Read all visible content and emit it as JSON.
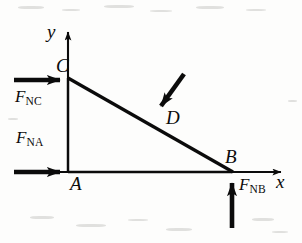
{
  "figure": {
    "type": "free-body-diagram",
    "background_color": "#fdfdfc",
    "ink_color": "#0b0b0b"
  },
  "axes": {
    "x_label": "x",
    "y_label": "y",
    "origin_label": "A",
    "x_axis": {
      "from_x": 14,
      "to_x": 288,
      "y": 172
    },
    "y_axis": {
      "x": 68,
      "from_y": 172,
      "to_y": 25
    }
  },
  "points": [
    {
      "name": "A",
      "label": "A",
      "x": 68,
      "y": 172,
      "label_dx": 4,
      "label_dy": 16
    },
    {
      "name": "B",
      "label": "B",
      "x": 232,
      "y": 172,
      "label_dx": -2,
      "label_dy": -8
    },
    {
      "name": "C",
      "label": "C",
      "x": 68,
      "y": 78,
      "label_dx": -8,
      "label_dy": -8
    },
    {
      "name": "D",
      "label": "D",
      "x": 152,
      "y": 117,
      "label_dx": 14,
      "label_dy": 10
    }
  ],
  "shape": {
    "name": "triangle-ABC",
    "vertices": "A(68,172) C(68,78) B(232,172)",
    "hypotenuse": "C to B"
  },
  "forces": [
    {
      "id": "FNC",
      "symbol": "F",
      "subscript": "NC",
      "applied_at": "C",
      "direction": "right",
      "tail_x": 14,
      "tail_y": 80,
      "head_x": 67,
      "head_y": 80,
      "label_x": 16,
      "label_y": 90
    },
    {
      "id": "FNA",
      "symbol": "F",
      "subscript": "NA",
      "applied_at": "A",
      "direction": "right",
      "tail_x": 14,
      "tail_y": 172,
      "head_x": 67,
      "head_y": 172,
      "label_x": 17,
      "label_y": 131
    },
    {
      "id": "FNB",
      "symbol": "F",
      "subscript": "NB",
      "applied_at": "B",
      "direction": "up",
      "tail_x": 232,
      "tail_y": 228,
      "head_x": 232,
      "head_y": 174,
      "label_x": 240,
      "label_y": 176
    },
    {
      "id": "FD",
      "symbol": "",
      "subscript": "",
      "applied_at": "D",
      "direction": "down-left perpendicular to incline",
      "tail_x": 184,
      "tail_y": 74,
      "head_x": 153,
      "head_y": 117,
      "label_x": 0,
      "label_y": 0
    }
  ],
  "colors": {
    "ink": "#0b0b0b",
    "paper": "#fdfdfc",
    "speck": "#c9c9c6"
  }
}
